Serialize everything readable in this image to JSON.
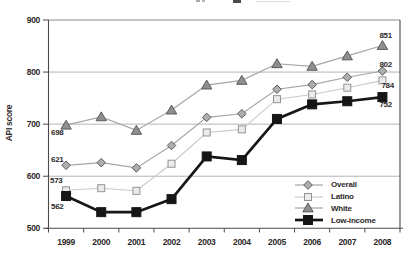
{
  "figure": {
    "note": "top chart title is cropped out of frame; only pixel fragments of glyph bottoms are visible"
  },
  "chart_data": {
    "type": "line",
    "title": "",
    "xlabel": "",
    "ylabel": "API score",
    "categories": [
      "1999",
      "2000",
      "2001",
      "2002",
      "2003",
      "2004",
      "2005",
      "2006",
      "2007",
      "2008"
    ],
    "ylim": [
      500,
      900
    ],
    "yticks": [
      900,
      800,
      700,
      600,
      500
    ],
    "grid": "horizontal",
    "legend_position": "inside-bottom-right",
    "axis_color": "#4a4a4a",
    "grid_color": "#b5b5b5",
    "text_color": "#2d292a",
    "series": [
      {
        "name": "Overall",
        "marker": "diamond",
        "line_color": "#a6a6a6",
        "line_width": 1.2,
        "marker_fill": "#aeaeae",
        "marker_stroke": "#5c5c5c",
        "values": [
          621,
          626,
          616,
          659,
          713,
          720,
          767,
          776,
          790,
          802
        ]
      },
      {
        "name": "Latino",
        "marker": "open-square",
        "line_color": "#c9c9c9",
        "line_width": 1.1,
        "marker_fill": "#ebebeb",
        "marker_stroke": "#949494",
        "values": [
          573,
          577,
          572,
          624,
          684,
          690,
          748,
          757,
          770,
          784
        ]
      },
      {
        "name": "White",
        "marker": "triangle",
        "line_color": "#a6a6a6",
        "line_width": 1.2,
        "marker_fill": "#8f8f8f",
        "marker_stroke": "#5c5c5c",
        "values": [
          698,
          714,
          688,
          727,
          775,
          784,
          816,
          811,
          831,
          851
        ]
      },
      {
        "name": "Low-income",
        "marker": "filled-square",
        "line_color": "#161616",
        "line_width": 2.7,
        "marker_fill": "#161616",
        "marker_stroke": "#161616",
        "values": [
          562,
          531,
          531,
          556,
          638,
          631,
          710,
          738,
          744,
          752
        ]
      }
    ],
    "point_labels": [
      {
        "series_index": 2,
        "point_index": 0,
        "text": "698",
        "dx": -15,
        "dy": 10
      },
      {
        "series_index": 0,
        "point_index": 0,
        "text": "621",
        "dx": -15,
        "dy": -3
      },
      {
        "series_index": 1,
        "point_index": 0,
        "text": "573",
        "dx": -16,
        "dy": -7
      },
      {
        "series_index": 3,
        "point_index": 0,
        "text": "562",
        "dx": -15,
        "dy": 13
      },
      {
        "series_index": 2,
        "point_index": 9,
        "text": "851",
        "dx": -3,
        "dy": -8
      },
      {
        "series_index": 0,
        "point_index": 9,
        "text": "802",
        "dx": -3,
        "dy": -4
      },
      {
        "series_index": 1,
        "point_index": 9,
        "text": "784",
        "dx": -1,
        "dy": 8
      },
      {
        "series_index": 3,
        "point_index": 9,
        "text": "752",
        "dx": -3,
        "dy": 10
      }
    ]
  }
}
